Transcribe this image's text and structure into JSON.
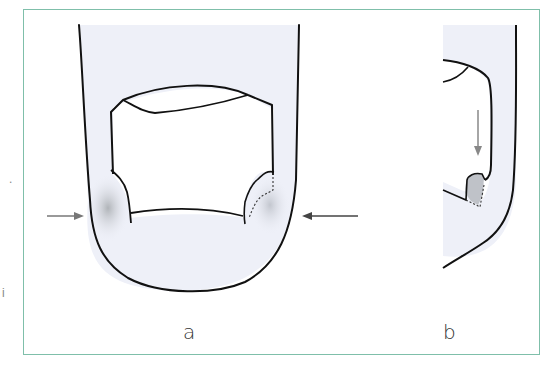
{
  "figure": {
    "panels": [
      {
        "id": "a",
        "label": "a",
        "description": "dorsal view of fingertip with nail plate; lateral nail folds shaded, arrows pointing inward from both sides"
      },
      {
        "id": "b",
        "label": "b",
        "description": "lateral view of fingertip; downward arrow pointing to shaded lateral nail fold region"
      }
    ],
    "stray_marks": [
      ".",
      "i"
    ],
    "colors": {
      "frame_border": "#7fbfaa",
      "skin_fill": "#eef0f8",
      "shade": "#b8bcc0",
      "outline": "#111111",
      "arrow": "#777777"
    }
  }
}
